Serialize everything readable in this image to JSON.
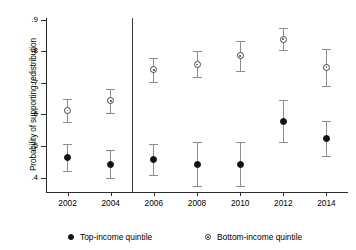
{
  "chart_data": {
    "type": "scatter",
    "title": "",
    "subtitle": "",
    "xlabel": "",
    "ylabel": "Probability of supporting redistribution",
    "categories": [
      "2002",
      "2004",
      "2006",
      "2008",
      "2010",
      "2012",
      "2014"
    ],
    "x": [
      2002,
      2004,
      2006,
      2008,
      2010,
      2012,
      2014
    ],
    "ylim": [
      0.355,
      0.905
    ],
    "xlim": [
      2001,
      2015
    ],
    "ytick_labels": [
      ".4",
      ".5",
      ".6",
      ".7",
      ".8",
      ".9"
    ],
    "ytick_values": [
      0.4,
      0.5,
      0.6,
      0.7,
      0.8,
      0.9
    ],
    "xtick_labels": [
      "2002",
      "2004",
      "2006",
      "2008",
      "2010",
      "2012",
      "2014"
    ],
    "grid": false,
    "legend_position": "bottom",
    "error_bars": "95% confidence interval",
    "annotations": [
      {
        "type": "vertical-reference-line",
        "x": 2005,
        "label": ""
      }
    ],
    "series": [
      {
        "name": "Top-income quintile",
        "marker": "filled-circle",
        "color": "#111111",
        "values": [
          0.465,
          0.443,
          0.459,
          0.443,
          0.443,
          0.578,
          0.525
        ],
        "ci_low": [
          0.421,
          0.4,
          0.41,
          0.374,
          0.374,
          0.512,
          0.47
        ],
        "ci_high": [
          0.508,
          0.487,
          0.508,
          0.512,
          0.513,
          0.645,
          0.581
        ]
      },
      {
        "name": "Bottom-income quintile",
        "marker": "open-circle",
        "color": "#444444",
        "values": [
          0.613,
          0.643,
          0.741,
          0.758,
          0.785,
          0.838,
          0.75
        ],
        "ci_low": [
          0.577,
          0.605,
          0.704,
          0.717,
          0.738,
          0.803,
          0.691
        ],
        "ci_high": [
          0.65,
          0.682,
          0.779,
          0.8,
          0.831,
          0.873,
          0.808
        ]
      }
    ]
  },
  "legend": {
    "items": [
      {
        "label": "Top-income quintile",
        "marker": "filled-circle"
      },
      {
        "label": "Bottom-income quintile",
        "marker": "open-circle"
      }
    ]
  }
}
